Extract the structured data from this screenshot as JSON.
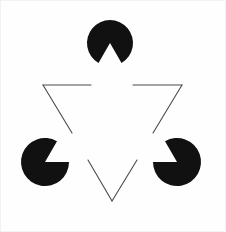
{
  "figure": {
    "kind": "illusory-contour-figure",
    "canvas": {
      "width": 226,
      "height": 232
    },
    "background_color": "#fefefe",
    "panel_edge_color": "#f2f2f2",
    "ink_color": "#111111",
    "outline_color": "#4a4a4a",
    "outline_stroke_width": 1.1,
    "illusory_triangle_note": "upright white triangle perceived between the three notched discs",
    "discs": [
      {
        "name": "top-disc",
        "cx": 110,
        "cy": 43,
        "r": 23,
        "fill": "#111111",
        "wedge_start_deg": 60,
        "wedge_end_deg": 120,
        "wedge_direction": "down"
      },
      {
        "name": "bottom-left-disc",
        "cx": 45,
        "cy": 162,
        "r": 24,
        "fill": "#111111",
        "wedge_start_deg": 300,
        "wedge_end_deg": 360,
        "wedge_direction": "upper-right"
      },
      {
        "name": "bottom-right-disc",
        "cx": 177,
        "cy": 162,
        "r": 24,
        "fill": "#111111",
        "wedge_start_deg": 180,
        "wedge_end_deg": 240,
        "wedge_direction": "upper-left"
      }
    ],
    "outline_triangle": {
      "name": "inverted-outline-triangle",
      "vertices": [
        {
          "label": "top-left",
          "x": 43,
          "y": 85
        },
        {
          "label": "top-right",
          "x": 182,
          "y": 85
        },
        {
          "label": "bottom-apex",
          "x": 112,
          "y": 201
        }
      ],
      "segments": [
        {
          "name": "top-edge-left-part",
          "x1": 43,
          "y1": 85,
          "x2": 91,
          "y2": 85
        },
        {
          "name": "top-edge-right-part",
          "x1": 133,
          "y1": 85,
          "x2": 182,
          "y2": 85
        },
        {
          "name": "left-edge-upper-part",
          "x1": 43,
          "y1": 85,
          "x2": 72,
          "y2": 133
        },
        {
          "name": "left-edge-lower-part",
          "x1": 88,
          "y1": 160,
          "x2": 112,
          "y2": 201
        },
        {
          "name": "right-edge-upper-part",
          "x1": 182,
          "y1": 85,
          "x2": 153,
          "y2": 133
        },
        {
          "name": "right-edge-lower-part",
          "x1": 137,
          "y1": 160,
          "x2": 112,
          "y2": 201
        }
      ]
    }
  }
}
